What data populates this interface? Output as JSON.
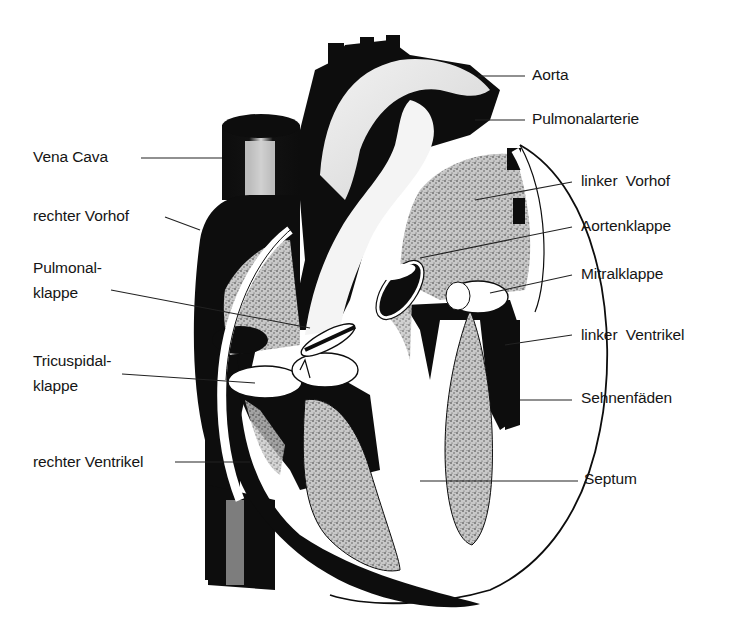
{
  "diagram": {
    "colors": {
      "ink": "#0d0d0d",
      "stipple": "#b4b4b4",
      "paper": "#ffffff",
      "text": "#151515"
    },
    "labels_left": [
      {
        "id": "vena-cava",
        "text": "Vena Cava",
        "x": 33,
        "y": 148
      },
      {
        "id": "rechter-vorhof",
        "text": "rechter Vorhof",
        "x": 33,
        "y": 207
      },
      {
        "id": "pulmonalklappe-1",
        "text": "Pulmonal-",
        "x": 33,
        "y": 259
      },
      {
        "id": "pulmonalklappe-2",
        "text": "klappe",
        "x": 33,
        "y": 284
      },
      {
        "id": "tricuspidalklappe-1",
        "text": "Tricuspidal-",
        "x": 33,
        "y": 352
      },
      {
        "id": "tricuspidalklappe-2",
        "text": "klappe",
        "x": 33,
        "y": 377
      },
      {
        "id": "rechter-ventrikel",
        "text": "rechter Ventrikel",
        "x": 33,
        "y": 453
      }
    ],
    "labels_right": [
      {
        "id": "aorta",
        "text": "Aorta",
        "x": 532,
        "y": 66
      },
      {
        "id": "pulmonalarterie",
        "text": "Pulmonalarterie",
        "x": 532,
        "y": 110
      },
      {
        "id": "linker-vorhof",
        "text": "linker  Vorhof",
        "x": 581,
        "y": 172
      },
      {
        "id": "aortenklappe",
        "text": "Aortenklappe",
        "x": 581,
        "y": 217
      },
      {
        "id": "mitralklappe",
        "text": "Mitralklappe",
        "x": 581,
        "y": 265
      },
      {
        "id": "linker-ventrikel",
        "text": "linker  Ventrikel",
        "x": 581,
        "y": 326
      },
      {
        "id": "sehnenfaeden",
        "text": "Sehnenfäden",
        "x": 581,
        "y": 389
      },
      {
        "id": "septum",
        "text": "Septum",
        "x": 584,
        "y": 470
      }
    ]
  }
}
